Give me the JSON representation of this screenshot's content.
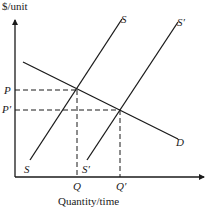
{
  "diagram": {
    "type": "supply-demand-shift",
    "y_axis_label": "$/unit",
    "x_axis_label": "Quantity/time",
    "price_labels": {
      "p": "P",
      "p_prime": "P′"
    },
    "quantity_labels": {
      "q": "Q",
      "q_prime": "Q′"
    },
    "curves": {
      "supply": {
        "label_top": "S",
        "label_bottom": "S"
      },
      "supply_shifted": {
        "label_top": "S′",
        "label_bottom": "S′"
      },
      "demand": {
        "label": "D"
      }
    },
    "line_color": "#1a1a1a",
    "background": "#ffffff"
  }
}
